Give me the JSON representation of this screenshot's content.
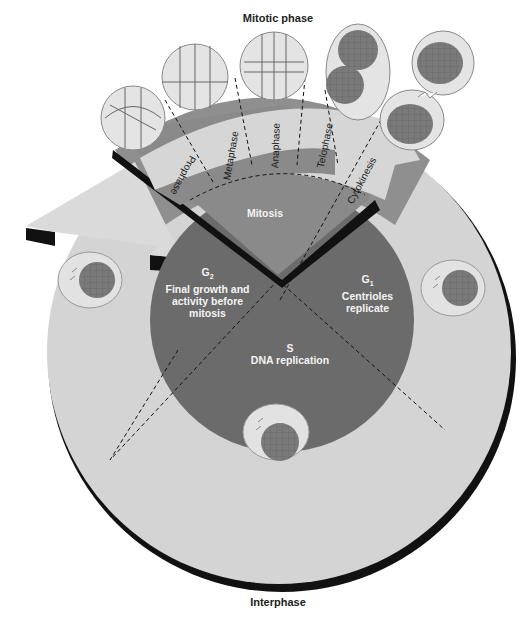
{
  "diagram": {
    "title_top": "Mitotic phase",
    "title_bottom": "Interphase",
    "center": {
      "mitosis_label": "Mitosis"
    },
    "interphase_sectors": [
      {
        "id": "g1",
        "symbol": "G",
        "subscript": "1",
        "description_line1": "Centrioles",
        "description_line2": "replicate"
      },
      {
        "id": "s",
        "symbol": "S",
        "description_line1": "DNA replication"
      },
      {
        "id": "g2",
        "symbol": "G",
        "subscript": "2",
        "description_line1": "Final growth and",
        "description_line2": "activity before",
        "description_line3": "mitosis"
      }
    ],
    "mitotic_stages": [
      {
        "id": "prophase",
        "label": "Prophase"
      },
      {
        "id": "metaphase",
        "label": "Metaphase"
      },
      {
        "id": "anaphase",
        "label": "Anaphase"
      },
      {
        "id": "telophase",
        "label": "Telophase"
      },
      {
        "id": "cytokinesis",
        "label": "Cytokinesis"
      }
    ],
    "colors": {
      "outer_ring": "#d4d4d4",
      "inner_disc": "#6e6e6e",
      "mitosis_wedge": "#8c8c8c",
      "mitotic_band": "#9a9a9a",
      "arrow_light": "#d8d8d8",
      "shadow": "#111111",
      "cell_nucleus": "#7a7a7a",
      "cell_body": "#e6e6e6"
    }
  }
}
